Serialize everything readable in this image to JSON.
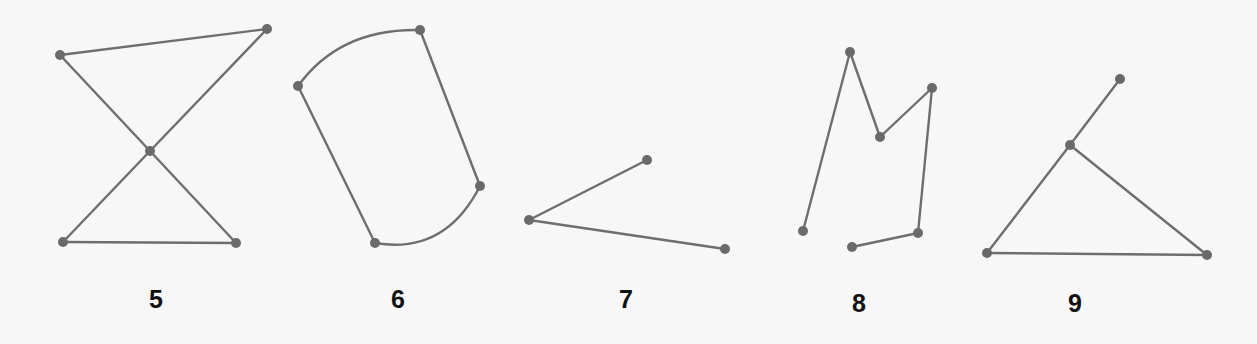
{
  "figures": [
    {
      "label": "5",
      "label_pos": [
        156,
        300
      ],
      "nodes": [
        [
          60,
          55
        ],
        [
          267,
          29
        ],
        [
          150,
          151
        ],
        [
          63,
          242
        ],
        [
          236,
          243
        ]
      ],
      "edges": [
        [
          0,
          1
        ],
        [
          0,
          2
        ],
        [
          2,
          4
        ],
        [
          1,
          2
        ],
        [
          2,
          3
        ],
        [
          3,
          4
        ]
      ],
      "arcs": []
    },
    {
      "label": "6",
      "label_pos": [
        398,
        300
      ],
      "nodes": [
        [
          298,
          86
        ],
        [
          420,
          30
        ],
        [
          480,
          186
        ],
        [
          375,
          243
        ]
      ],
      "edges": [
        [
          1,
          2
        ],
        [
          0,
          3
        ]
      ],
      "arcs": [
        {
          "from": 0,
          "to": 1,
          "ctrl": [
            340,
            28
          ]
        },
        {
          "from": 2,
          "to": 3,
          "ctrl": [
            445,
            255
          ]
        }
      ]
    },
    {
      "label": "7",
      "label_pos": [
        626,
        300
      ],
      "nodes": [
        [
          647,
          160
        ],
        [
          529,
          220
        ],
        [
          725,
          249
        ]
      ],
      "edges": [
        [
          0,
          1
        ],
        [
          1,
          2
        ]
      ],
      "arcs": []
    },
    {
      "label": "8",
      "label_pos": [
        859,
        304
      ],
      "nodes": [
        [
          803,
          231
        ],
        [
          850,
          52
        ],
        [
          880,
          137
        ],
        [
          932,
          88
        ],
        [
          918,
          233
        ],
        [
          852,
          247
        ]
      ],
      "edges": [
        [
          0,
          1
        ],
        [
          1,
          2
        ],
        [
          2,
          3
        ],
        [
          3,
          4
        ],
        [
          4,
          5
        ]
      ],
      "arcs": []
    },
    {
      "label": "9",
      "label_pos": [
        1075,
        304
      ],
      "nodes": [
        [
          1120,
          79
        ],
        [
          1070,
          145
        ],
        [
          987,
          253
        ],
        [
          1207,
          255
        ]
      ],
      "edges": [
        [
          0,
          1
        ],
        [
          1,
          2
        ],
        [
          1,
          3
        ],
        [
          2,
          3
        ]
      ],
      "arcs": []
    }
  ],
  "colors": {
    "edge": "#6e6e6e",
    "node": "#6a6a6a",
    "label": "#111111",
    "background": "#f7f7f7"
  },
  "node_radius": 5
}
